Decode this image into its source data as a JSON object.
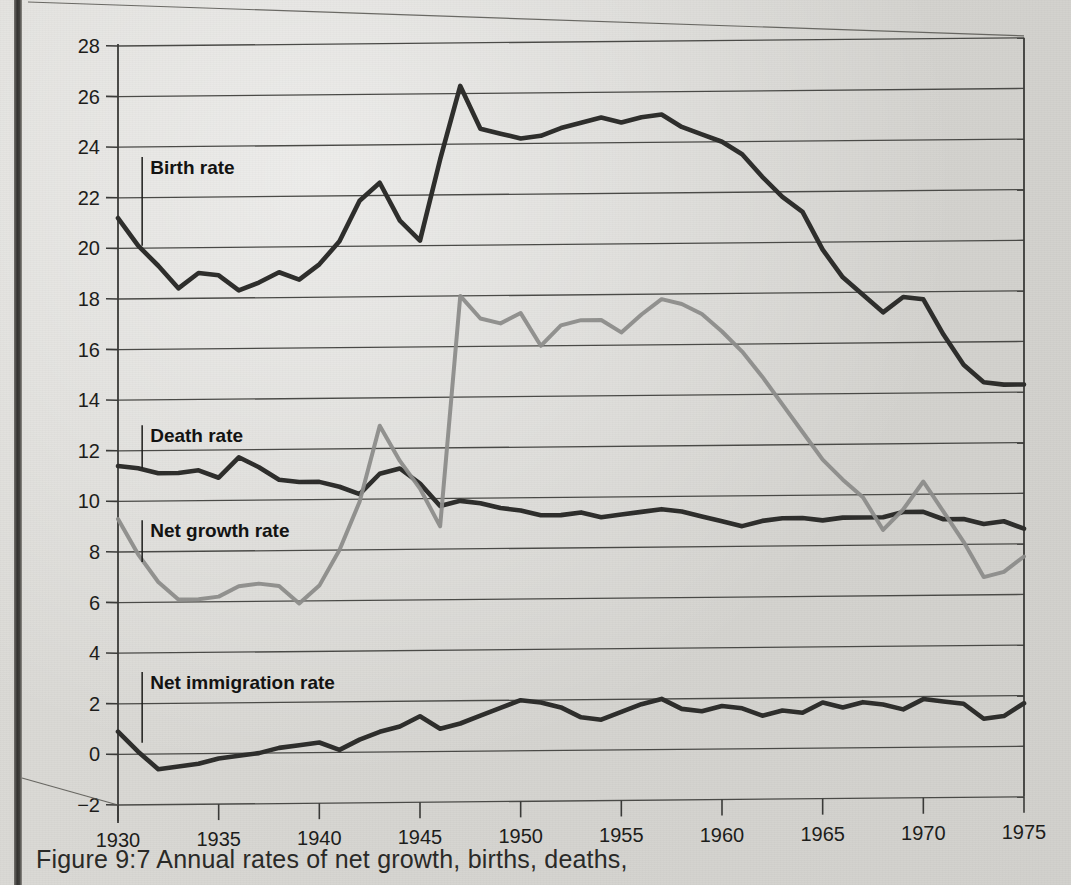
{
  "figure": {
    "caption": "Figure 9:7 Annual rates of net growth, births, deaths,"
  },
  "series_labels": {
    "birth": "Birth rate",
    "death": "Death rate",
    "net_growth": "Net growth rate",
    "net_immigration": "Net immigration rate"
  },
  "colors": {
    "paper": "#d8d7d3",
    "dark_line": "#2e2e2c",
    "gray_line": "#8c8c8a",
    "axis": "#3a3a38",
    "grid": "#4a4a47",
    "text": "#1d1d1b"
  },
  "chart_data": {
    "type": "line",
    "title": "Figure 9:7 Annual rates of net growth, births, deaths,",
    "xlabel": "",
    "ylabel": "",
    "xlim": [
      1930,
      1975
    ],
    "ylim": [
      -2,
      28
    ],
    "ytick_step": 2,
    "xtick_step": 5,
    "grid": true,
    "legend_position": "inline-labels",
    "xticks": [
      1930,
      1935,
      1940,
      1945,
      1950,
      1955,
      1960,
      1965,
      1970,
      1975
    ],
    "yticks": [
      -2,
      0,
      2,
      4,
      6,
      8,
      10,
      12,
      14,
      16,
      18,
      20,
      22,
      24,
      26,
      28
    ],
    "x": [
      1930,
      1931,
      1932,
      1933,
      1934,
      1935,
      1936,
      1937,
      1938,
      1939,
      1940,
      1941,
      1942,
      1943,
      1944,
      1945,
      1946,
      1947,
      1948,
      1949,
      1950,
      1951,
      1952,
      1953,
      1954,
      1955,
      1956,
      1957,
      1958,
      1959,
      1960,
      1961,
      1962,
      1963,
      1964,
      1965,
      1966,
      1967,
      1968,
      1969,
      1970,
      1971,
      1972,
      1973,
      1974,
      1975
    ],
    "series": [
      {
        "name": "Birth rate",
        "color": "#2e2e2c",
        "values": [
          21.2,
          20.1,
          19.3,
          18.4,
          19.0,
          18.9,
          18.3,
          18.6,
          19.0,
          18.7,
          19.3,
          20.2,
          21.8,
          22.5,
          21.0,
          20.2,
          23.4,
          26.3,
          24.6,
          24.4,
          24.2,
          24.3,
          24.6,
          24.8,
          25.0,
          24.8,
          25.0,
          25.1,
          24.6,
          24.3,
          24.0,
          23.5,
          22.6,
          21.8,
          21.2,
          19.7,
          18.6,
          17.9,
          17.2,
          17.8,
          17.7,
          16.3,
          15.1,
          14.4,
          14.3,
          14.3
        ]
      },
      {
        "name": "Death rate",
        "color": "#2e2e2c",
        "values": [
          11.4,
          11.3,
          11.1,
          11.1,
          11.2,
          10.9,
          11.7,
          11.3,
          10.8,
          10.7,
          10.7,
          10.5,
          10.2,
          11.0,
          11.2,
          10.6,
          9.7,
          9.9,
          9.8,
          9.6,
          9.5,
          9.3,
          9.3,
          9.4,
          9.2,
          9.3,
          9.4,
          9.5,
          9.4,
          9.2,
          9.0,
          8.8,
          9.0,
          9.1,
          9.1,
          9.0,
          9.1,
          9.1,
          9.1,
          9.3,
          9.3,
          9.0,
          9.0,
          8.8,
          8.9,
          8.6
        ]
      },
      {
        "name": "Net growth rate",
        "color": "#8c8c8a",
        "values": [
          9.3,
          7.9,
          6.8,
          6.1,
          6.1,
          6.2,
          6.6,
          6.7,
          6.6,
          5.9,
          6.6,
          8.0,
          9.9,
          12.9,
          11.5,
          10.4,
          8.9,
          18.0,
          17.1,
          16.9,
          17.3,
          16.0,
          16.8,
          17.0,
          17.0,
          16.5,
          17.2,
          17.8,
          17.6,
          17.2,
          16.5,
          15.7,
          14.7,
          13.6,
          12.5,
          11.4,
          10.6,
          9.9,
          8.6,
          9.4,
          10.5,
          9.3,
          8.1,
          6.7,
          6.9,
          7.5
        ]
      },
      {
        "name": "Net immigration rate",
        "color": "#2e2e2c",
        "values": [
          0.9,
          0.1,
          -0.6,
          -0.5,
          -0.4,
          -0.2,
          -0.1,
          0.0,
          0.2,
          0.3,
          0.4,
          0.1,
          0.5,
          0.8,
          1.0,
          1.4,
          0.9,
          1.1,
          1.4,
          1.7,
          2.0,
          1.9,
          1.7,
          1.3,
          1.2,
          1.5,
          1.8,
          2.0,
          1.6,
          1.5,
          1.7,
          1.6,
          1.3,
          1.5,
          1.4,
          1.8,
          1.6,
          1.8,
          1.7,
          1.5,
          1.9,
          1.8,
          1.7,
          1.1,
          1.2,
          1.7
        ]
      }
    ]
  }
}
